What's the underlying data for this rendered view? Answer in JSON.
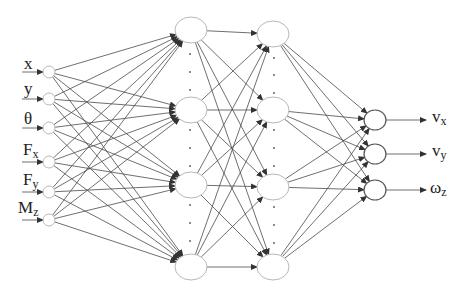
{
  "diagram": {
    "type": "neural-network",
    "input_labels": [
      {
        "main": "x",
        "sub": ""
      },
      {
        "main": "y",
        "sub": ""
      },
      {
        "main": "θ",
        "sub": ""
      },
      {
        "main": "F",
        "sub": "x"
      },
      {
        "main": "F",
        "sub": "y"
      },
      {
        "main": "M",
        "sub": "z"
      }
    ],
    "output_labels": [
      {
        "main": "v",
        "sub": "x"
      },
      {
        "main": "v",
        "sub": "y"
      },
      {
        "main": "ω",
        "sub": "z"
      }
    ],
    "layers": [
      {
        "name": "input",
        "x": 49,
        "ys": [
          72,
          99,
          128,
          162,
          192,
          220
        ],
        "rx": 6,
        "ry": 6
      },
      {
        "name": "hidden-1",
        "x": 191,
        "ys": [
          30,
          110,
          185,
          267
        ],
        "rx": 16,
        "ry": 13
      },
      {
        "name": "hidden-2",
        "x": 273,
        "ys": [
          34,
          110,
          187,
          267
        ],
        "rx": 16,
        "ry": 13
      },
      {
        "name": "output",
        "x": 375,
        "ys": [
          120,
          154,
          190
        ],
        "rx": 11,
        "ry": 10
      }
    ],
    "ellipsis_dots": [
      {
        "x": 190,
        "ys": [
          54,
          72,
          90,
          130,
          148,
          166,
          205,
          223,
          241
        ]
      },
      {
        "x": 274,
        "ys": [
          58,
          75,
          93,
          130,
          148,
          166,
          207,
          225,
          243
        ]
      }
    ],
    "colors": {
      "edge": "#4a4a4a",
      "node_stroke": "#b8b8b8",
      "output_stroke": "#555555",
      "text": "#222222"
    }
  }
}
